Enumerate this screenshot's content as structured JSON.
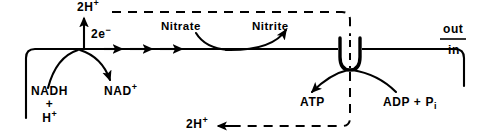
{
  "diagram": {
    "colors": {
      "ink": "#000000",
      "background": "#ffffff"
    },
    "compartments": {
      "outside_label": "out",
      "inside_label": "in"
    },
    "labels": {
      "protons_out": "2H",
      "protons_out_charge": "+",
      "electrons": "2e",
      "electrons_charge": "−",
      "nadh": "NADH",
      "nadh_plus": "+",
      "nadh_proton": "H",
      "nadh_proton_charge": "+",
      "nad_oxidized": "NAD",
      "nad_oxidized_charge": "+",
      "nitrate": "Nitrate",
      "nitrite": "Nitrite",
      "atp": "ATP",
      "adp": "ADP + P",
      "adp_sub": "i",
      "protons_in": "2H",
      "protons_in_charge": "+"
    },
    "components": [
      {
        "name": "membrane-line",
        "kind": "boundary"
      },
      {
        "name": "atp-synthase",
        "kind": "enzyme-complex"
      },
      {
        "name": "electron-transport-chain",
        "kind": "pathway"
      },
      {
        "name": "proton-circuit",
        "kind": "dashed-circuit"
      }
    ]
  }
}
